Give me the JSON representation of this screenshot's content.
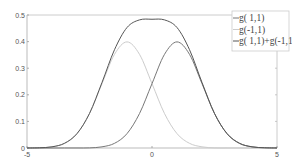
{
  "chart_data": {
    "type": "line",
    "title": "",
    "xlabel": "",
    "ylabel": "",
    "xlim": [
      -5,
      5
    ],
    "ylim": [
      0,
      0.5
    ],
    "grid": false,
    "legend_position": "upper right",
    "x_ticks": [
      "-5",
      "0",
      "5"
    ],
    "y_ticks": [
      "0",
      "0.1",
      "0.2",
      "0.3",
      "0.4",
      "0.5"
    ],
    "x": [
      -5,
      -4.5,
      -4,
      -3.5,
      -3,
      -2.5,
      -2,
      -1.5,
      -1,
      -0.5,
      0,
      0.5,
      1,
      1.5,
      2,
      2.5,
      3,
      3.5,
      4,
      4.5,
      5
    ],
    "series": [
      {
        "name": "g( 1,1)",
        "color": "#777777",
        "values": [
          0.0,
          0.0,
          0.0,
          0.0001,
          0.0001,
          0.0004,
          0.0044,
          0.0175,
          0.054,
          0.1295,
          0.242,
          0.3521,
          0.3989,
          0.3521,
          0.242,
          0.1295,
          0.054,
          0.0175,
          0.0044,
          0.0009,
          0.0001
        ]
      },
      {
        "name": "g(-1,1)",
        "color": "#cccccc",
        "values": [
          0.0001,
          0.0009,
          0.0044,
          0.0175,
          0.054,
          0.1295,
          0.242,
          0.3521,
          0.3989,
          0.3521,
          0.242,
          0.1295,
          0.054,
          0.0175,
          0.0044,
          0.0004,
          0.0001,
          0.0001,
          0.0,
          0.0,
          0.0
        ]
      },
      {
        "name": "g( 1,1)+g(-1,1)",
        "color": "#555555",
        "values": [
          0.0001,
          0.0009,
          0.0044,
          0.0176,
          0.0541,
          0.1299,
          0.2464,
          0.3696,
          0.4529,
          0.4816,
          0.484,
          0.4816,
          0.4529,
          0.3696,
          0.2464,
          0.1299,
          0.0541,
          0.0176,
          0.0044,
          0.0009,
          0.0001
        ]
      }
    ]
  },
  "legend": {
    "items": [
      "g( 1,1)",
      "g(-1,1)",
      "g( 1,1)+g(-1,1)"
    ]
  }
}
